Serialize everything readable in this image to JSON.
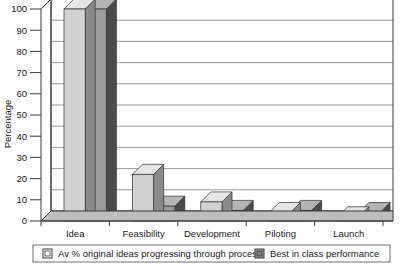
{
  "chart_data": {
    "type": "bar",
    "title": "",
    "xlabel": "",
    "ylabel": "Percentage",
    "ylim": [
      0,
      100
    ],
    "yticks": [
      0,
      10,
      20,
      30,
      40,
      50,
      60,
      70,
      80,
      90,
      100
    ],
    "ytick_labels": [
      "0",
      "10",
      "20",
      "30",
      "40",
      "50",
      "60",
      "70",
      "80",
      "90",
      "100"
    ],
    "categories": [
      "Idea",
      "Feasibility",
      "Development",
      "Piloting",
      "Launch"
    ],
    "grid": true,
    "grid_axis": "y",
    "legend_position": "bottom",
    "style": "3d-column",
    "series": [
      {
        "name": "Av % original ideas progressing through process",
        "color": "#d2d2d2",
        "top_color": "#e6e6e6",
        "side_color": "#8a8a8a",
        "values": [
          100,
          22,
          9,
          4,
          2
        ]
      },
      {
        "name": "Best in class performance",
        "color": "#9b9b9b",
        "top_color": "#b4b4b4",
        "side_color": "#4a4a4a",
        "values": [
          100,
          7,
          5,
          5,
          4
        ]
      }
    ]
  },
  "legend": {
    "items": [
      {
        "label": "Av % original ideas progressing through process",
        "swatch": "light-square-marker"
      },
      {
        "label": "Best in class performance",
        "swatch": "dark-square-marker"
      }
    ]
  },
  "colors": {
    "axis": "#3a3a3a",
    "grid": "#8d8d8d",
    "plot_background": "#ffffff",
    "text": "#1a1a1a",
    "legend_border": "#6e6e6e"
  }
}
